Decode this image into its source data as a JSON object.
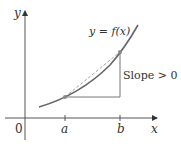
{
  "diagram": {
    "labels": {
      "y_axis": "y",
      "x_axis": "x",
      "origin": "0",
      "point_a": "a",
      "point_b": "b",
      "function": "y = f(x)",
      "slope": "Slope > 0"
    },
    "colors": {
      "axis": "#555555",
      "curve": "#666666",
      "secant": "#999999",
      "triangle": "#777777",
      "point": "#888888",
      "text": "#333333"
    }
  }
}
